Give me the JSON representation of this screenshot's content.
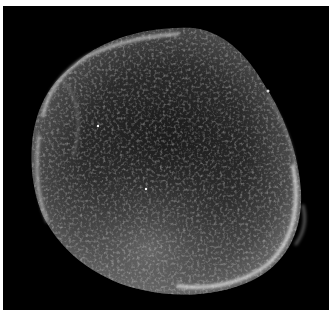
{
  "image": {
    "subject": "supernova-remnant-shell",
    "background_color": "#000000",
    "border_color": "#ffffff",
    "shell_color": "#cfcfcf"
  }
}
